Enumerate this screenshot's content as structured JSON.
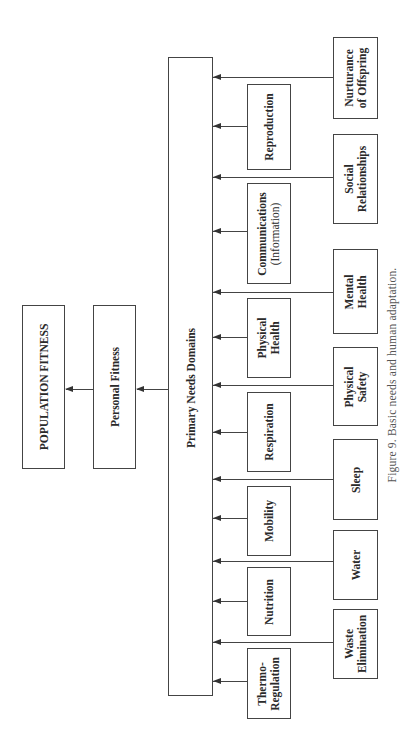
{
  "diagram": {
    "top": {
      "label": "POPULATION FITNESS"
    },
    "middle": {
      "label": "Personal Fitness"
    },
    "domains": {
      "label": "Primary Needs Domains"
    },
    "inner_needs": [
      {
        "line1": "Reproduction",
        "line2": ""
      },
      {
        "line1": "Communications",
        "line2": "(Information)"
      },
      {
        "line1": "Physical",
        "line2": "Health"
      },
      {
        "line1": "Respiration",
        "line2": ""
      },
      {
        "line1": "Mobility",
        "line2": ""
      },
      {
        "line1": "Nutrition",
        "line2": ""
      },
      {
        "line1": "Thermo-",
        "line2": "Regulation"
      }
    ],
    "outer_needs": [
      {
        "line1": "Nurturance",
        "line2": "of Offspring"
      },
      {
        "line1": "Social",
        "line2": "Relationships"
      },
      {
        "line1": "Mental",
        "line2": "Health"
      },
      {
        "line1": "Physical",
        "line2": "Safety"
      },
      {
        "line1": "Sleep",
        "line2": ""
      },
      {
        "line1": "Water",
        "line2": ""
      },
      {
        "line1": "Waste",
        "line2": "Elimination"
      }
    ]
  },
  "caption": "Figure 9. Basic needs and human adaptation."
}
